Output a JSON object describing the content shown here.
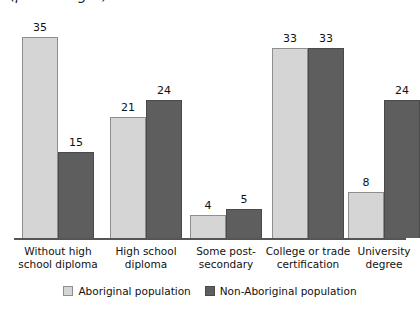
{
  "title_partial": "(percentages)",
  "legend": {
    "position": "bottom-center",
    "entries": [
      {
        "label": "Aboriginal population",
        "color": "#d5d5d5",
        "swatch": "light"
      },
      {
        "label": "Non-Aboriginal population",
        "color": "#5e5e5e",
        "swatch": "dark"
      }
    ]
  },
  "chart_data": {
    "type": "bar",
    "title": "",
    "subtitle": "",
    "xlabel": "",
    "ylabel": "",
    "ylim": [
      0,
      35
    ],
    "grid": false,
    "legend_position": "bottom-center",
    "categories": [
      "Without high school diploma",
      "High school diploma",
      "Some post-secondary",
      "College or trade certification",
      "University degree"
    ],
    "category_lines": [
      [
        "Without high",
        "school diploma"
      ],
      [
        "High school",
        "diploma"
      ],
      [
        "Some post-",
        "secondary"
      ],
      [
        "College or trade",
        "certification"
      ],
      [
        "University",
        "degree"
      ]
    ],
    "series": [
      {
        "name": "Aboriginal population",
        "color": "#d5d5d5",
        "values": [
          35,
          21,
          4,
          33,
          8
        ]
      },
      {
        "name": "Non-Aboriginal population",
        "color": "#5e5e5e",
        "values": [
          15,
          24,
          5,
          33,
          24
        ]
      }
    ]
  },
  "render": {
    "max_value": 35,
    "max_bar_px": 201,
    "bar_width_px": 36,
    "group_left_px": [
      22,
      110,
      190,
      272,
      348
    ]
  }
}
